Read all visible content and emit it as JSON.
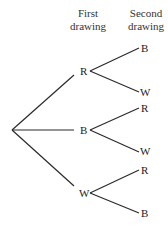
{
  "headers": {
    "first": [
      "First",
      "drawing"
    ],
    "second": [
      "Second",
      "drawing"
    ]
  },
  "tree": {
    "first_level": [
      {
        "label": "R",
        "children": [
          "B",
          "W"
        ]
      },
      {
        "label": "B",
        "children": [
          "R",
          "W"
        ]
      },
      {
        "label": "W",
        "children": [
          "R",
          "B"
        ]
      }
    ]
  },
  "colors": {
    "line": "#2a2a2a",
    "text": "#222222",
    "background": "#ffffff"
  }
}
